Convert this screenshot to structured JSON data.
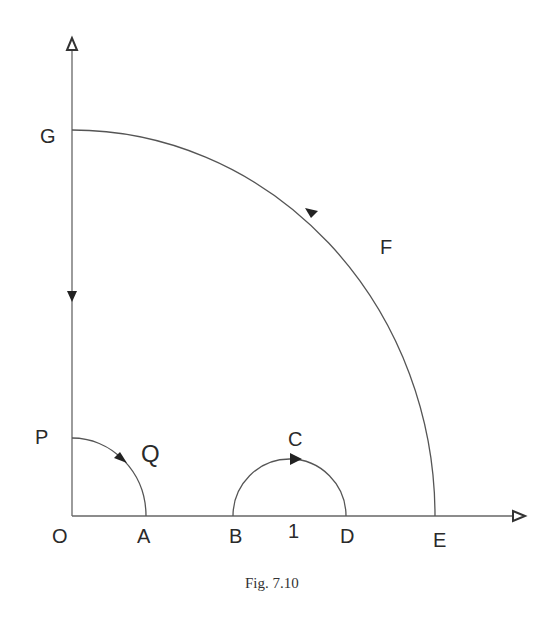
{
  "diagram": {
    "caption": "Fig. 7.10",
    "colors": {
      "line": "#555555",
      "arrow": "#222222",
      "text": "#2a2a2a"
    },
    "labels": {
      "O": "O",
      "A": "A",
      "B": "B",
      "one": "1",
      "D": "D",
      "E": "E",
      "P": "P",
      "Q": "Q",
      "C": "C",
      "F": "F",
      "G": "G"
    },
    "elements": [
      "vertical axis with arrow up",
      "horizontal axis with arrow right",
      "small quarter arc P to A (Q) clockwise",
      "semicircle B to D through C, arrow rightward",
      "large quarter arc E to G (F), arrow toward G",
      "downward arrow on vertical axis from G toward P"
    ]
  }
}
